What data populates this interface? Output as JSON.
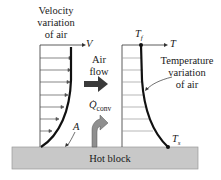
{
  "diagram": {
    "velocity_label": [
      "Velocity",
      "variation",
      "of air"
    ],
    "velocity_axis": "V",
    "air_flow_label": [
      "Air",
      "flow"
    ],
    "heat_label": "Q",
    "heat_sub": "conv",
    "point_a": "A",
    "temp_top": "T",
    "temp_top_sub": "f",
    "temp_axis": "T",
    "temp_label": [
      "Temperature",
      "variation",
      "of air"
    ],
    "temp_bottom": "T",
    "temp_bottom_sub": "s",
    "block_label": "Hot block",
    "colors": {
      "block": "#c8c8c8",
      "arrow": "#3a3a3a",
      "heat_arrow": "#8f8f8f",
      "line": "#111111",
      "grid": "#9a9a9a"
    }
  }
}
